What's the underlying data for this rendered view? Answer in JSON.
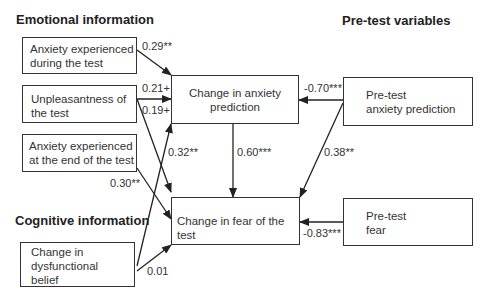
{
  "headings": {
    "emotional": "Emotional information",
    "cognitive": "Cognitive information",
    "pretest": "Pre-test variables"
  },
  "nodes": {
    "anx_during": "Anxiety experienced\nduring the test",
    "unpleasant": "Unpleasantness of\nthe test",
    "anx_end": "Anxiety experienced\nat the end of the test",
    "dysfunc": "Change in\ndysfunctional\nbelief",
    "change_anx": "Change in anxiety\nprediction",
    "change_fear": "Change in fear of the test",
    "pre_anx": "Pre-test\nanxiety prediction",
    "pre_fear": "Pre-test\nfear"
  },
  "paths": [
    {
      "from": "Anxiety experienced during the test",
      "to": "Change in anxiety prediction",
      "coef": "0.29**"
    },
    {
      "from": "Unpleasantness of the test",
      "to": "Change in anxiety prediction",
      "coef": "0.21+"
    },
    {
      "from": "Unpleasantness of the test",
      "to": "Change in fear of the test",
      "coef": "0.19+"
    },
    {
      "from": "Change in dysfunctional belief",
      "to": "Change in anxiety prediction",
      "coef": "0.32**"
    },
    {
      "from": "Anxiety experienced at the end of the test",
      "to": "Change in fear of the test",
      "coef": "0.30**"
    },
    {
      "from": "Change in dysfunctional belief",
      "to": "Change in fear of the test",
      "coef": "0.01"
    },
    {
      "from": "Change in anxiety prediction",
      "to": "Change in fear of the test",
      "coef": "0.60***"
    },
    {
      "from": "Pre-test anxiety prediction",
      "to": "Change in anxiety prediction",
      "coef": "-0.70***"
    },
    {
      "from": "Pre-test anxiety prediction",
      "to": "Change in fear of the test",
      "coef": "0.38**"
    },
    {
      "from": "Pre-test fear",
      "to": "Change in fear of the test",
      "coef": "-0.83***"
    }
  ]
}
